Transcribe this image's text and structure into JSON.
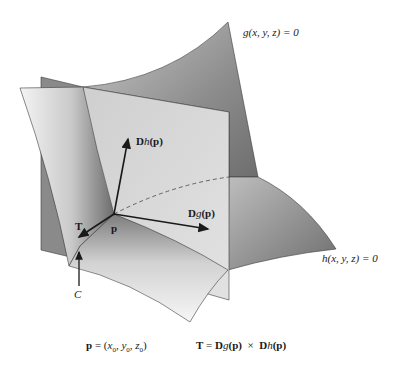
{
  "figure": {
    "surfaces": [
      {
        "name": "g-surface",
        "equation": "g(x, y, z) = 0"
      },
      {
        "name": "h-surface",
        "equation": "h(x, y, z) = 0"
      }
    ],
    "vectors": [
      {
        "name": "Dh(p)",
        "label_bold": "D",
        "label_italic": "h",
        "label_rest": "(p)"
      },
      {
        "name": "Dg(p)",
        "label_bold": "D",
        "label_italic": "g",
        "label_rest": "(p)"
      },
      {
        "name": "T",
        "label": "T"
      }
    ],
    "point_label": "p",
    "curve_label": "C",
    "labels": {
      "g_eq_fn": "g",
      "g_eq_rest": "(x, y, z) = 0",
      "h_eq_fn": "h",
      "h_eq_rest": "(x, y, z) = 0",
      "Dh_D": "D",
      "Dh_h": "h",
      "Dh_p": "(p)",
      "Dg_D": "D",
      "Dg_g": "g",
      "Dg_p": "(p)",
      "T": "T",
      "p": "p",
      "C": "C"
    },
    "caption": {
      "point_def_p": "p",
      "point_def_eq": " = (",
      "x0": "x",
      "y0": "y",
      "z0": "z",
      "sub0": "0",
      "tangent_T": "T",
      "tangent_eq": " = ",
      "tangent_D1": "D",
      "tangent_g": "g",
      "tangent_p1": "(p)",
      "tangent_times": "  ×  ",
      "tangent_D2": "D",
      "tangent_h": "h",
      "tangent_p2": "(p)"
    },
    "colors": {
      "dark_surface": "#7a7a7a",
      "mid_surface": "#a8a8a8",
      "light_plane": "#d9d9d9",
      "edge": "#3a3a3a",
      "text": "#1a1a1a"
    }
  }
}
